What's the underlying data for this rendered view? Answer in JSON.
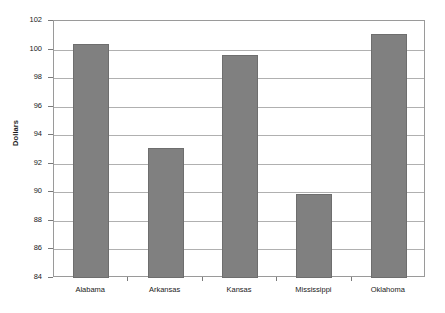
{
  "chart_data": {
    "type": "bar",
    "title": "",
    "xlabel": "",
    "ylabel": "Dollars",
    "categories": [
      "Alabama",
      "Arkansas",
      "Kansas",
      "Mississippi",
      "Oklahoma"
    ],
    "values": [
      100.4,
      93.1,
      99.6,
      89.9,
      101.1
    ],
    "ylim": [
      84,
      102
    ],
    "ytick_labels": [
      "102",
      "100",
      "98",
      "96",
      "94",
      "92",
      "90",
      "88",
      "86",
      "84"
    ],
    "ytick_values": [
      102,
      100,
      98,
      96,
      94,
      92,
      90,
      88,
      86,
      84
    ],
    "ytick_step": 2,
    "grid": "horizontal",
    "legend": "none",
    "bar_color": "#808080",
    "bar_border_color": "#6e6e6e",
    "gridline_color": "#b0b0b0",
    "axis_color": "#9a9a9a",
    "background_color": "#ffffff",
    "text_color": "#1a1a1a"
  }
}
